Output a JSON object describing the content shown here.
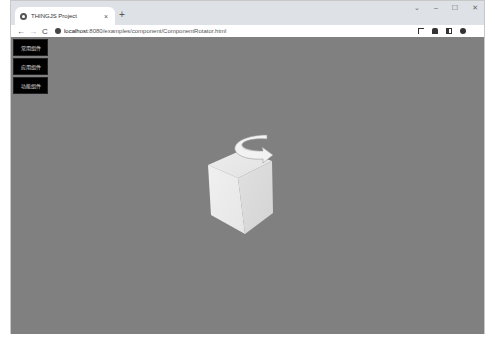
{
  "browser": {
    "tab": {
      "title": "THINGJS Project",
      "close_label": "×"
    },
    "new_tab_label": "+",
    "window_controls": {
      "minimize": "–",
      "maximize": "☐",
      "close": "✕",
      "dropdown": "⌄"
    },
    "nav": {
      "back": "←",
      "forward": "→",
      "reload": "C"
    },
    "address": {
      "host": "localhost",
      "path": ":8080/examples/component/ComponentRotator.html"
    },
    "toolbar_icons": [
      "screen-capture-icon",
      "extensions-icon",
      "side-panel-icon",
      "profile-icon",
      "menu-icon"
    ]
  },
  "viewport": {
    "background": "#808080",
    "buttons": [
      {
        "label": "常用组件"
      },
      {
        "label": "应用组件"
      },
      {
        "label": "功能组件"
      }
    ],
    "scene": {
      "object": "cube",
      "cube_color": "#e6e6e6",
      "rotator_arrow_color": "#f0f0f0"
    }
  }
}
